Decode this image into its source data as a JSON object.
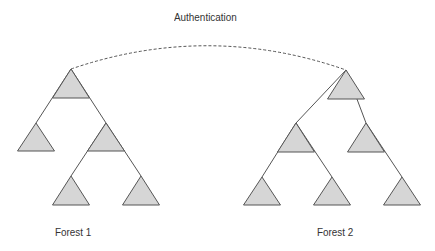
{
  "diagram": {
    "title": "Authentication",
    "forests": [
      {
        "label": "Forest 1",
        "domains": [
          {
            "id": "f1-root",
            "apex": [
              71,
              69
            ],
            "base_y": 98,
            "half_width": 18.5,
            "parent": null
          },
          {
            "id": "f1-a",
            "apex": [
              36,
              123
            ],
            "base_y": 151,
            "half_width": 18.5,
            "parent": "f1-root"
          },
          {
            "id": "f1-b",
            "apex": [
              106,
              123
            ],
            "base_y": 151,
            "half_width": 18.5,
            "parent": "f1-root"
          },
          {
            "id": "f1-b1",
            "apex": [
              71,
              176
            ],
            "base_y": 205,
            "half_width": 18.5,
            "parent": "f1-b"
          },
          {
            "id": "f1-b2",
            "apex": [
              141,
              176
            ],
            "base_y": 205,
            "half_width": 18.5,
            "parent": "f1-b"
          }
        ]
      },
      {
        "label": "Forest 2",
        "domains": [
          {
            "id": "f2-root",
            "apex": [
              346,
              70
            ],
            "base_y": 99,
            "half_width": 18.5,
            "parent": null
          },
          {
            "id": "f2-a",
            "apex": [
              296,
              123
            ],
            "base_y": 152,
            "half_width": 18.5,
            "parent": "f2-root"
          },
          {
            "id": "f2-b",
            "apex": [
              366,
              123
            ],
            "base_y": 152,
            "half_width": 18.5,
            "parent": "f2-root"
          },
          {
            "id": "f2-a1",
            "apex": [
              262,
              177
            ],
            "base_y": 205,
            "half_width": 18.5,
            "parent": "f2-a"
          },
          {
            "id": "f2-a2",
            "apex": [
              332,
              177
            ],
            "base_y": 205,
            "half_width": 18.5,
            "parent": "f2-a"
          },
          {
            "id": "f2-b1",
            "apex": [
              402,
              177
            ],
            "base_y": 205,
            "half_width": 18.5,
            "parent": "f2-b"
          }
        ]
      }
    ],
    "trust_link": {
      "from": "f1-root",
      "to": "f2-root",
      "style": "dashed",
      "label": "Authentication"
    },
    "colors": {
      "triangle_fill": "#d6d6d6",
      "stroke": "#555555",
      "text": "#333333"
    }
  }
}
